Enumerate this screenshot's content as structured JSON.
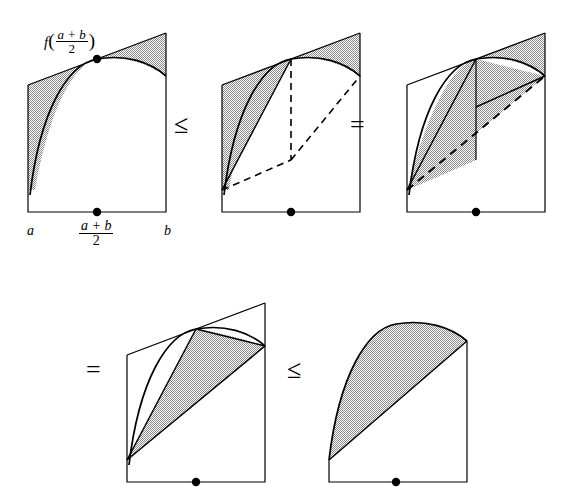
{
  "figure": {
    "background_color": "#ffffff",
    "stroke_color": "#000000",
    "shade_color": "#b8b8b8",
    "shade_style": "checkerboard-stipple"
  },
  "labels": {
    "f_of_midpoint": {
      "function_name": "f",
      "open_paren": "(",
      "numerator": "a + b",
      "denominator": "2",
      "close_paren": ")"
    },
    "axis_left": "a",
    "axis_right": "b",
    "axis_mid_numerator": "a + b",
    "axis_mid_denominator": "2"
  },
  "relations": {
    "op1": "≤",
    "op2": "=",
    "op3": "=",
    "op4": "≤"
  },
  "panels": [
    {
      "id": "panel-1",
      "name": "tangent-line-panel",
      "description": "Concave curve from a to b with tangent line at midpoint; regions between tangent and curve shaded.",
      "shaded_regions": 2,
      "has_dashed_guides": false,
      "has_midpoint_dot": true,
      "has_tangent_dot": true
    },
    {
      "id": "panel-2",
      "name": "shifted-region-panel",
      "description": "Left shaded region plus translated right region, dashed outline shows original right-hand placement.",
      "shaded_regions": 2,
      "has_dashed_guides": true,
      "has_midpoint_dot": true,
      "has_tangent_dot": false
    },
    {
      "id": "panel-3",
      "name": "recombined-region-panel",
      "description": "Shaded parallelogram-like region shifted right with dashed chord from lower-left to upper-right.",
      "shaded_regions": 1,
      "has_dashed_guides": true,
      "has_midpoint_dot": true,
      "has_tangent_dot": false
    },
    {
      "id": "panel-4",
      "name": "chord-lens-panel",
      "description": "Single shaded lens between the chord and the curve over the full interval.",
      "shaded_regions": 1,
      "has_dashed_guides": false,
      "has_midpoint_dot": true,
      "has_tangent_dot": false
    },
    {
      "id": "panel-5",
      "name": "final-lens-panel",
      "description": "Final shaded lens region between curve and chord, equal to the trapezoid comparison.",
      "shaded_regions": 1,
      "has_dashed_guides": false,
      "has_midpoint_dot": true,
      "has_tangent_dot": false
    }
  ]
}
